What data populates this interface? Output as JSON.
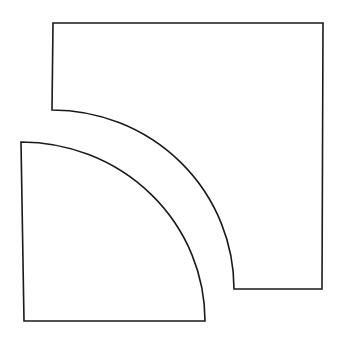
{
  "diagram": {
    "background": "#ffffff",
    "stroke_color": "#1a1a1a",
    "shapes": [
      {
        "name": "upper-square-with-quarter-cutout",
        "description": "Square with a concave quarter-circle notch cut from the bottom-left corner",
        "path": "M 53 23 L 323 23 L 322 289 L 234 289 A 182 179 0 0 0 52 110 Z"
      },
      {
        "name": "lower-quarter-circle",
        "description": "Quarter-circle sector with right angle at bottom-left",
        "path": "M 21 142 A 184 179 0 0 1 205 321 L 24 321 Z"
      }
    ]
  }
}
